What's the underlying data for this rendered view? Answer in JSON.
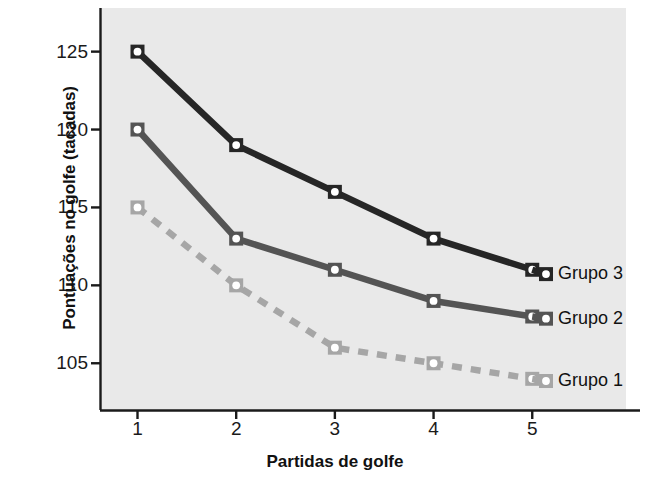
{
  "chart_data": {
    "type": "line",
    "title": "",
    "xlabel": "Partidas de golfe",
    "ylabel": "Pontuações no golfe (tacadas)",
    "x": [
      1,
      2,
      3,
      4,
      5
    ],
    "xticklabels": [
      "1",
      "2",
      "3",
      "4",
      "5"
    ],
    "yticks": [
      105,
      110,
      115,
      120,
      125
    ],
    "yticklabels": [
      "105",
      "110",
      "115",
      "120",
      "125"
    ],
    "xlim": [
      0.62,
      5.95
    ],
    "ylim": [
      102.0,
      127.8
    ],
    "grid": false,
    "legend_position": "right-inline",
    "series": [
      {
        "name": "Grupo 3",
        "values": [
          125,
          119,
          116,
          113,
          111
        ],
        "color": "#262626",
        "linestyle": "solid",
        "marker": "square",
        "marker_fill": "#ffffff"
      },
      {
        "name": "Grupo 2",
        "values": [
          120,
          113,
          111,
          109,
          108
        ],
        "color": "#545454",
        "linestyle": "solid",
        "marker": "square",
        "marker_fill": "#ffffff"
      },
      {
        "name": "Grupo 1",
        "values": [
          115,
          110,
          106,
          105,
          104
        ],
        "color": "#a6a6a6",
        "linestyle": "dashed",
        "marker": "square",
        "marker_fill": "#ffffff"
      }
    ]
  },
  "style": {
    "plot_background": "#e9e9e9",
    "axis_color": "#1a1a1a",
    "text_color": "#111111"
  }
}
